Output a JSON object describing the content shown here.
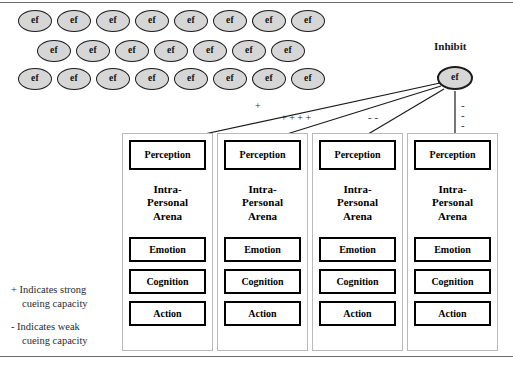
{
  "figure": {
    "ef_label": "ef",
    "inhibit_label": "Inhibit"
  },
  "ef_grid": {
    "row1_count": 8,
    "row2_count": 7,
    "row3_count": 8,
    "node_label": "ef"
  },
  "signs": {
    "plus": "+",
    "minus": "-",
    "plus_cluster": "+ + + +",
    "minus_pair": "-  -",
    "minus_stack": [
      "-",
      "-",
      "-"
    ]
  },
  "arenas": [
    {
      "perception": "Perception",
      "title_line1": "Intra-",
      "title_line2": "Personal",
      "title_line3": "Arena",
      "emotion": "Emotion",
      "cognition": "Cognition",
      "action": "Action"
    },
    {
      "perception": "Perception",
      "title_line1": "Intra-",
      "title_line2": "Personal",
      "title_line3": "Arena",
      "emotion": "Emotion",
      "cognition": "Cognition",
      "action": "Action"
    },
    {
      "perception": "Perception",
      "title_line1": "Intra-",
      "title_line2": "Personal",
      "title_line3": "Arena",
      "emotion": "Emotion",
      "cognition": "Cognition",
      "action": "Action"
    },
    {
      "perception": "Perception",
      "title_line1": "Intra-",
      "title_line2": "Personal",
      "title_line3": "Arena",
      "emotion": "Emotion",
      "cognition": "Cognition",
      "action": "Action"
    }
  ],
  "legend": {
    "strong_line1": "+ Indicates strong",
    "strong_line2": "cueing capacity",
    "weak_line1": "- Indicates weak",
    "weak_line2": "cueing capacity"
  },
  "colors": {
    "node_fill": "#d6d6d6",
    "node_stroke": "#1b1b1b",
    "box_stroke": "#000000",
    "container_stroke": "#b9b9b9",
    "rule": "#6b6b72"
  }
}
